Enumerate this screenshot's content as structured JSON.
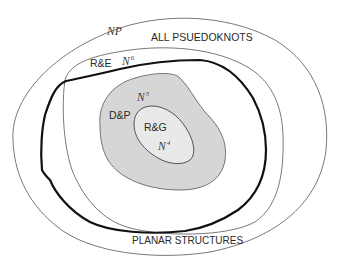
{
  "diagram": {
    "type": "nested-set-diagram",
    "colors": {
      "background": "#ffffff",
      "thin_line": "#555555",
      "thick_line": "#111111",
      "dp_fill": "#d6d6d6",
      "rg_fill": "#e9e9e9"
    },
    "regions": [
      {
        "id": "all-pseudoknots",
        "label": "ALL PSUEDOKNOTS",
        "complexity": {
          "base": "NP",
          "exp": ""
        }
      },
      {
        "id": "re",
        "label": "R&E",
        "complexity": {
          "base": "N",
          "exp": "6"
        }
      },
      {
        "id": "dp",
        "label": "D&P",
        "complexity": {
          "base": "N",
          "exp": "5"
        }
      },
      {
        "id": "rg",
        "label": "R&G",
        "complexity": {
          "base": "N",
          "exp": "4"
        }
      },
      {
        "id": "planar",
        "label": "PLANAR STRUCTURES"
      }
    ]
  }
}
